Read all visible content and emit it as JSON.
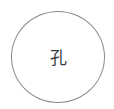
{
  "badge": {
    "character": "孔",
    "border_color": "#8a8a8a",
    "text_color": "#3c3c3c"
  }
}
